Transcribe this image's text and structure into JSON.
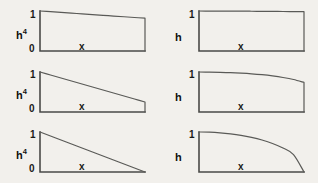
{
  "figure": {
    "background_color": "#f2f0ec",
    "ink_color": "#4a4a48",
    "width": 318,
    "height": 183
  },
  "chart_data": [
    {
      "id": "top-left",
      "type": "line",
      "title": "",
      "xlabel": "x",
      "ylabel": "h",
      "ylabel_exponent": "4",
      "ylabel_display": "h^4",
      "ytick_labels": [
        "0",
        "1"
      ],
      "ytick_values": [
        0,
        1
      ],
      "xtick_labels": [],
      "xlim": [
        0,
        1
      ],
      "ylim": [
        0,
        1
      ],
      "grid": false,
      "legend": false,
      "x": [
        0.0,
        0.1,
        0.2,
        0.3,
        0.4,
        0.5,
        0.6,
        0.7,
        0.8,
        0.9,
        1.0
      ],
      "values": [
        1.0,
        0.982,
        0.964,
        0.946,
        0.928,
        0.91,
        0.892,
        0.874,
        0.856,
        0.838,
        0.82
      ],
      "end_value": 0.82,
      "drop_to_zero_at_end": true,
      "description": "gentle linear decline from 1 to 0.82 with vertical drop at right edge"
    },
    {
      "id": "top-right",
      "type": "line",
      "title": "",
      "xlabel": "x",
      "ylabel": "h",
      "ylabel_exponent": "",
      "ylabel_display": "h",
      "ytick_labels": [
        "1"
      ],
      "ytick_values": [
        1
      ],
      "xtick_labels": [],
      "xlim": [
        0,
        1
      ],
      "ylim": [
        0,
        1
      ],
      "grid": false,
      "legend": false,
      "x": [
        0.0,
        0.1,
        0.2,
        0.3,
        0.4,
        0.5,
        0.6,
        0.7,
        0.8,
        0.9,
        1.0
      ],
      "values": [
        1.0,
        0.999,
        0.998,
        0.997,
        0.996,
        0.994,
        0.992,
        0.99,
        0.988,
        0.985,
        0.982
      ],
      "end_value": 0.982,
      "drop_to_zero_at_end": true,
      "description": "essentially flat at 1 with vertical drop at right edge"
    },
    {
      "id": "middle-left",
      "type": "line",
      "title": "",
      "xlabel": "x",
      "ylabel": "h",
      "ylabel_exponent": "4",
      "ylabel_display": "h^4",
      "ytick_labels": [
        "0",
        "1"
      ],
      "ytick_values": [
        0,
        1
      ],
      "xtick_labels": [],
      "xlim": [
        0,
        1
      ],
      "ylim": [
        0,
        1
      ],
      "grid": false,
      "legend": false,
      "x": [
        0.0,
        0.1,
        0.2,
        0.3,
        0.4,
        0.5,
        0.6,
        0.7,
        0.8,
        0.9,
        1.0
      ],
      "values": [
        1.0,
        0.925,
        0.85,
        0.775,
        0.7,
        0.625,
        0.55,
        0.475,
        0.4,
        0.325,
        0.25
      ],
      "end_value": 0.25,
      "drop_to_zero_at_end": true,
      "description": "steeper linear decline from 1 to 0.25 with vertical drop at right edge"
    },
    {
      "id": "middle-right",
      "type": "line",
      "title": "",
      "xlabel": "x",
      "ylabel": "h",
      "ylabel_exponent": "",
      "ylabel_display": "h",
      "ytick_labels": [
        "1"
      ],
      "ytick_values": [
        1
      ],
      "xtick_labels": [],
      "xlim": [
        0,
        1
      ],
      "ylim": [
        0,
        1
      ],
      "grid": false,
      "legend": false,
      "x": [
        0.0,
        0.1,
        0.2,
        0.3,
        0.4,
        0.5,
        0.6,
        0.7,
        0.8,
        0.9,
        1.0
      ],
      "values": [
        1.0,
        0.998,
        0.993,
        0.985,
        0.972,
        0.955,
        0.932,
        0.902,
        0.863,
        0.812,
        0.74
      ],
      "end_value": 0.74,
      "drop_to_zero_at_end": true,
      "description": "concave curve flat near origin then bending down to 0.74 with vertical drop at right edge"
    },
    {
      "id": "bottom-left",
      "type": "line",
      "title": "",
      "xlabel": "x",
      "ylabel": "h",
      "ylabel_exponent": "4",
      "ylabel_display": "h^4",
      "ytick_labels": [
        "0",
        "1"
      ],
      "ytick_values": [
        0,
        1
      ],
      "xtick_labels": [],
      "xlim": [
        0,
        1
      ],
      "ylim": [
        0,
        1
      ],
      "grid": false,
      "legend": false,
      "x": [
        0.0,
        0.1,
        0.2,
        0.3,
        0.4,
        0.5,
        0.6,
        0.7,
        0.8,
        0.9,
        1.0
      ],
      "values": [
        1.0,
        0.9,
        0.8,
        0.7,
        0.6,
        0.5,
        0.4,
        0.3,
        0.2,
        0.1,
        0.0
      ],
      "end_value": 0.0,
      "drop_to_zero_at_end": false,
      "description": "full linear triangle from 1 down to 0 at right edge"
    },
    {
      "id": "bottom-right",
      "type": "line",
      "title": "",
      "xlabel": "x",
      "ylabel": "h",
      "ylabel_exponent": "",
      "ylabel_display": "h",
      "ytick_labels": [
        "1"
      ],
      "ytick_values": [
        1
      ],
      "xtick_labels": [],
      "xlim": [
        0,
        1
      ],
      "ylim": [
        0,
        1
      ],
      "grid": false,
      "legend": false,
      "x": [
        0.0,
        0.1,
        0.2,
        0.3,
        0.4,
        0.5,
        0.6,
        0.7,
        0.8,
        0.9,
        1.0
      ],
      "values": [
        1.0,
        0.995,
        0.98,
        0.954,
        0.917,
        0.866,
        0.8,
        0.714,
        0.6,
        0.436,
        0.0
      ],
      "end_value": 0.0,
      "drop_to_zero_at_end": false,
      "description": "quarter-ellipse decay from 1 falling steeply to 0 at right edge"
    }
  ]
}
